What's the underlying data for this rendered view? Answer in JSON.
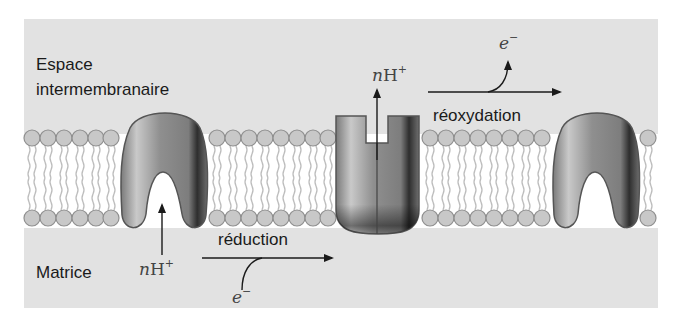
{
  "diagram": {
    "title": "",
    "regions": {
      "top_label_line1": "Espace",
      "top_label_line2": "intermembranaire",
      "bottom_label": "Matrice"
    },
    "processes": {
      "reduction": "réduction",
      "reoxidation": "réoxydation"
    },
    "species": {
      "protons_in": {
        "coef": "n",
        "symbol": "H",
        "charge": "+"
      },
      "protons_out": {
        "coef": "n",
        "symbol": "H",
        "charge": "+"
      },
      "electron_in": {
        "symbol": "e",
        "charge": "−"
      },
      "electron_out": {
        "symbol": "e",
        "charge": "−"
      }
    },
    "colors": {
      "background": "#e2e2e2",
      "membrane_band": "#ffffff",
      "lipid_head": "#c8c8c8",
      "lipid_head_stroke": "#8f8f8f",
      "lipid_tail": "#b8b8b8",
      "protein_fill": "#8a8a8a",
      "protein_stroke": "#555555",
      "arrow": "#1a1a1a"
    }
  }
}
